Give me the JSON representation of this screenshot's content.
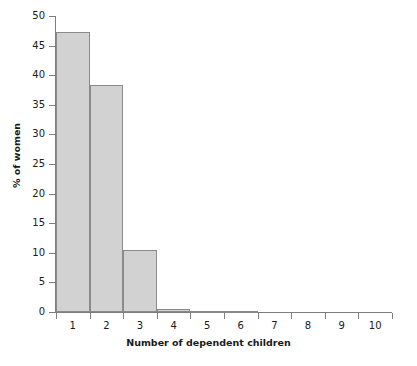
{
  "chart_data": {
    "type": "bar",
    "title": "",
    "xlabel": "Number of dependent children",
    "ylabel": "% of women",
    "categories": [
      "1",
      "2",
      "3",
      "4",
      "5",
      "6",
      "7",
      "8",
      "9",
      "10"
    ],
    "values": [
      47.3,
      38.4,
      10.5,
      0.5,
      0.1,
      0.1,
      0.0,
      0.0,
      0.0,
      0.0
    ],
    "ylim": [
      0,
      50
    ],
    "xlim": [
      0,
      10
    ],
    "yticks": [
      0,
      5,
      10,
      15,
      20,
      25,
      30,
      35,
      40,
      45,
      50
    ],
    "ytick_labels": [
      "0",
      "5",
      "10",
      "15",
      "20",
      "25",
      "30",
      "35",
      "40",
      "45",
      "50"
    ],
    "xtick_labels": [
      "1",
      "2",
      "3",
      "4",
      "5",
      "6",
      "7",
      "8",
      "9",
      "10"
    ],
    "grid": false,
    "legend": null,
    "bar_fill_color": "#d2d2d2",
    "bar_edge_color": "#8a8a8a",
    "axis_color": "#7d7d7d",
    "background_color": "#ffffff"
  }
}
